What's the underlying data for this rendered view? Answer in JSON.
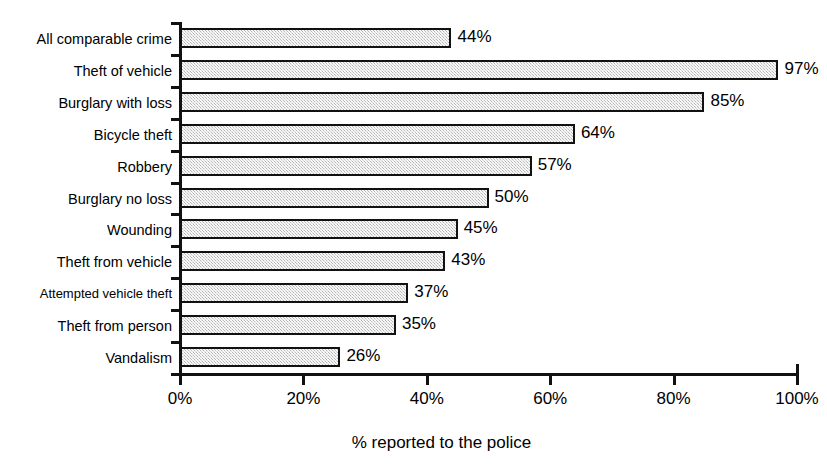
{
  "chart_data": {
    "type": "bar",
    "orientation": "horizontal",
    "title": "",
    "xlabel": "% reported to the police",
    "ylabel": "",
    "xlim": [
      0,
      100
    ],
    "xticks": [
      "0%",
      "20%",
      "40%",
      "60%",
      "80%",
      "100%"
    ],
    "xtick_values": [
      0,
      20,
      40,
      60,
      80,
      100
    ],
    "grid": false,
    "legend": null,
    "categories": [
      "All comparable crime",
      "Theft of vehicle",
      "Burglary with loss",
      "Bicycle theft",
      "Robbery",
      "Burglary no loss",
      "Wounding",
      "Theft from vehicle",
      "Attempted vehicle theft",
      "Theft from person",
      "Vandalism"
    ],
    "values": [
      44,
      97,
      85,
      64,
      57,
      50,
      45,
      43,
      37,
      35,
      26
    ],
    "value_labels": [
      "44%",
      "97%",
      "85%",
      "64%",
      "57%",
      "50%",
      "45%",
      "43%",
      "37%",
      "35%",
      "26%"
    ],
    "bar_fill_color": "#d9d9d9",
    "bar_border_color": "#111111",
    "axis_color": "#111111",
    "background_color": "#ffffff"
  }
}
